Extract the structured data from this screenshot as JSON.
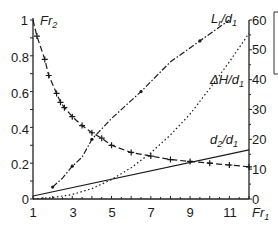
{
  "chart_data": {
    "type": "line",
    "title": "",
    "xlabel": "Fr1",
    "ylabel_left": "Fr2",
    "ylabel_right": "",
    "xlim": [
      1,
      12
    ],
    "ylim_left": [
      0,
      1
    ],
    "ylim_right": [
      0,
      60
    ],
    "x_ticks": [
      1,
      3,
      5,
      7,
      9,
      11
    ],
    "y_ticks_left": [
      0,
      0.2,
      0.4,
      0.6,
      0.8,
      1
    ],
    "y_ticks_left_labels": [
      "0",
      "0.2",
      "0.4",
      "0.6",
      "0.8",
      "1"
    ],
    "y_ticks_right": [
      0,
      10,
      20,
      30,
      40,
      50,
      60
    ],
    "grid": false,
    "legend": "inline labels",
    "series": [
      {
        "name": "Fr2",
        "axis": "left",
        "style": "dashed with + markers",
        "x": [
          1,
          1.2,
          1.6,
          1.8,
          2.2,
          2.4,
          2.6,
          3,
          3.5,
          4,
          4.5,
          5,
          6,
          7,
          8,
          9,
          10,
          11,
          12
        ],
        "values": [
          1.0,
          0.91,
          0.78,
          0.69,
          0.59,
          0.54,
          0.51,
          0.46,
          0.41,
          0.37,
          0.34,
          0.3,
          0.26,
          0.24,
          0.22,
          0.21,
          0.2,
          0.19,
          0.18
        ]
      },
      {
        "name": "Lr/d1",
        "axis": "right",
        "style": "dash-dot with dot markers",
        "x": [
          2,
          2.5,
          3,
          3.5,
          4,
          5,
          6.5,
          8,
          9.5,
          11
        ],
        "values": [
          4,
          7,
          11,
          14,
          20,
          27,
          36,
          46,
          53,
          60
        ]
      },
      {
        "name": "ΔH/d1",
        "axis": "right",
        "style": "dotted",
        "x": [
          1,
          2,
          3,
          4,
          5,
          6,
          7,
          8,
          9,
          10,
          11,
          12
        ],
        "values": [
          0,
          0.5,
          1.5,
          3.5,
          6.5,
          10.5,
          15.5,
          21.5,
          28.5,
          37,
          46,
          55.5
        ]
      },
      {
        "name": "d2/d1",
        "axis": "right",
        "style": "solid",
        "x": [
          1,
          12
        ],
        "values": [
          1,
          16.5
        ]
      }
    ],
    "annotations": [
      "Lr/d1",
      "ΔH/d1",
      "d2/d1",
      "Fr2",
      "Fr1"
    ]
  },
  "labels": {
    "fr2_main": "Fr",
    "fr2_sub": "2",
    "fr1_main": "Fr",
    "fr1_sub": "1",
    "lr_main": "L",
    "lr_sub": "r",
    "lr_rest": "/d",
    "lr_sub2": "1",
    "dh_main": "ΔH/d",
    "dh_sub": "1",
    "d2_main": "d",
    "d2_sub": "2",
    "d2_rest": "/d",
    "d2_sub2": "1"
  },
  "ticks": {
    "left": [
      "1",
      "0.8",
      "0.6",
      "0.4",
      "0.2",
      "0"
    ],
    "right": [
      "60",
      "50",
      "40",
      "30",
      "20",
      "10",
      "0"
    ],
    "x": [
      "1",
      "3",
      "5",
      "7",
      "9",
      "11"
    ]
  }
}
